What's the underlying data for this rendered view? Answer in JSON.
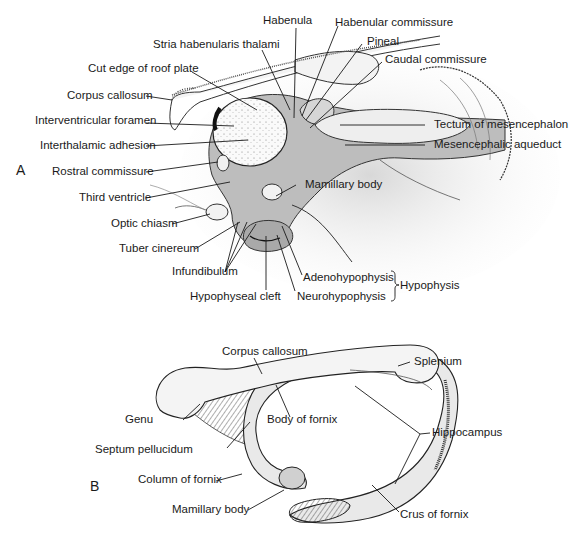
{
  "figure": {
    "panels": [
      {
        "id": "A",
        "label": "A"
      },
      {
        "id": "B",
        "label": "B"
      }
    ]
  },
  "panelA": {
    "labels": {
      "habenula": "Habenula",
      "habenular_commissure": "Habenular commissure",
      "stria_habenularis": "Stria habenularis thalami",
      "pineal": "Pineal",
      "cut_edge": "Cut edge of roof plate",
      "caudal_commissure": "Caudal commissure",
      "corpus_callosum": "Corpus callosum",
      "interventricular_foramen": "Interventricular foramen",
      "tectum": "Tectum of mesencephalon",
      "interthalamic_adhesion": "Interthalamic adhesion",
      "mesencephalic_aqueduct": "Mesencephalic aqueduct",
      "rostral_commissure": "Rostral commissure",
      "third_ventricle": "Third ventricle",
      "mamillary_body": "Mamillary body",
      "optic_chiasm": "Optic chiasm",
      "tuber_cinereum": "Tuber cinereum",
      "infundibulum": "Infundibulum",
      "adenohypophysis": "Adenohypophysis",
      "hypophyseal_cleft": "Hypophyseal cleft",
      "neurohypophysis": "Neurohypophysis",
      "hypophysis": "Hypophysis"
    }
  },
  "panelB": {
    "labels": {
      "corpus_callosum": "Corpus callosum",
      "splenium": "Splenium",
      "genu": "Genu",
      "body_of_fornix": "Body of fornix",
      "hippocampus": "Hippocampus",
      "septum_pellucidum": "Septum pellucidum",
      "column_of_fornix": "Column of fornix",
      "mamillary_body": "Mamillary body",
      "crus_of_fornix": "Crus of fornix"
    }
  },
  "colors": {
    "ventricle_fill": "#b9b9b9",
    "shade": "#e2e2e2",
    "line": "#1a1a1a"
  }
}
